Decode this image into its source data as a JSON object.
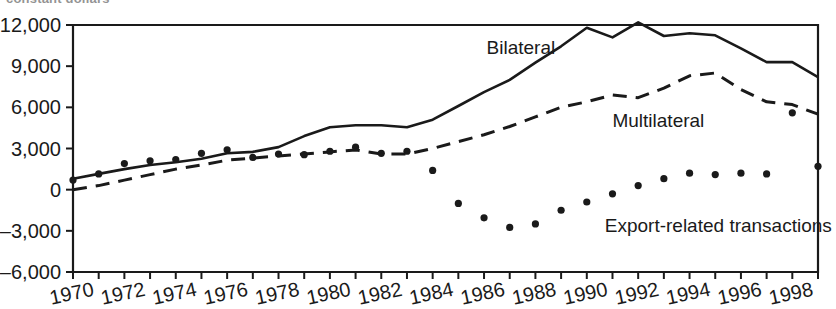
{
  "figure": {
    "cut_off_title": "constant dollars",
    "axis_color": "#1a1a1a",
    "series_color": "#1a1a1a"
  },
  "chart_data": {
    "type": "line",
    "title": "",
    "subtitle": "",
    "xlabel": "",
    "ylabel": "",
    "xlim": [
      1970,
      1999
    ],
    "ylim": [
      -6000,
      12000
    ],
    "yticks": [
      -6000,
      -3000,
      0,
      3000,
      6000,
      9000,
      12000
    ],
    "ytick_labels": [
      "–6,000",
      "–3,000",
      "0",
      "3,000",
      "6,000",
      "9,000",
      "12,000"
    ],
    "xticks": [
      1970,
      1971,
      1972,
      1973,
      1974,
      1975,
      1976,
      1977,
      1978,
      1979,
      1980,
      1981,
      1982,
      1983,
      1984,
      1985,
      1986,
      1987,
      1988,
      1989,
      1990,
      1991,
      1992,
      1993,
      1994,
      1995,
      1996,
      1997,
      1998,
      1999
    ],
    "xtick_labels": [
      "1970",
      "1972",
      "1974",
      "1976",
      "1978",
      "1980",
      "1982",
      "1984",
      "1986",
      "1988",
      "1990",
      "1992",
      "1994",
      "1996",
      "1998"
    ],
    "xtick_label_years": [
      1970,
      1972,
      1974,
      1976,
      1978,
      1980,
      1982,
      1984,
      1986,
      1988,
      1990,
      1992,
      1994,
      1996,
      1998
    ],
    "grid": false,
    "legend_position": "inline-annotations",
    "x": [
      1970,
      1971,
      1972,
      1973,
      1974,
      1975,
      1976,
      1977,
      1978,
      1979,
      1980,
      1981,
      1982,
      1983,
      1984,
      1985,
      1986,
      1987,
      1988,
      1989,
      1990,
      1991,
      1992,
      1993,
      1994,
      1995,
      1996,
      1997,
      1998,
      1999
    ],
    "series": [
      {
        "name": "Bilateral",
        "style": "solid",
        "label_x": 1986.1,
        "label_y": 9900,
        "values": [
          800,
          1150,
          1500,
          1800,
          2000,
          2250,
          2650,
          2750,
          3100,
          3900,
          4550,
          4700,
          4700,
          4550,
          5100,
          6100,
          7100,
          8000,
          9250,
          10450,
          11800,
          11100,
          12200,
          11200,
          11400,
          11250,
          10300,
          9300,
          9300,
          8200
        ]
      },
      {
        "name": "Multilateral",
        "style": "dashed",
        "label_x": 1991.0,
        "label_y": 4550,
        "values": [
          0,
          300,
          700,
          1100,
          1500,
          1800,
          2150,
          2300,
          2450,
          2600,
          2750,
          2900,
          2600,
          2600,
          3000,
          3500,
          4000,
          4600,
          5300,
          6000,
          6400,
          6900,
          6700,
          7400,
          8300,
          8500,
          7300,
          6400,
          6200,
          5500
        ]
      },
      {
        "name": "Export-related transactions",
        "style": "dotted",
        "label_x": 1990.7,
        "label_y": -3050,
        "values": [
          700,
          1150,
          1900,
          2100,
          2200,
          2650,
          2900,
          2350,
          2600,
          2550,
          2800,
          3100,
          2650,
          2800,
          1400,
          -1000,
          -2050,
          -2750,
          -2500,
          -1500,
          -900,
          -300,
          300,
          800,
          1200,
          1100,
          1200,
          1150,
          5600,
          1700
        ]
      }
    ]
  }
}
